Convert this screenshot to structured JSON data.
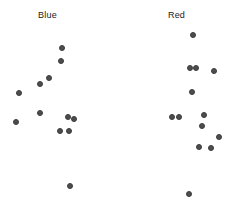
{
  "figure": {
    "width": 234,
    "height": 209,
    "background": "#ffffff"
  },
  "chart_data": {
    "type": "scatter",
    "title": "",
    "xlabel": "",
    "ylabel": "",
    "grid": false,
    "legend": "none",
    "marker": {
      "shape": "circle",
      "size_px": 6,
      "color": "#4d4d4d",
      "edge_color": "#3c3c3c",
      "opacity": 1
    },
    "xlim": [
      0,
      117
    ],
    "ylim": [
      209,
      0
    ],
    "panels": [
      {
        "name": "Blue",
        "label": "Blue",
        "origin_x": 0,
        "points": [
          {
            "x": 62,
            "y": 48
          },
          {
            "x": 61,
            "y": 61
          },
          {
            "x": 49,
            "y": 78
          },
          {
            "x": 40,
            "y": 84
          },
          {
            "x": 19,
            "y": 93
          },
          {
            "x": 40,
            "y": 113
          },
          {
            "x": 68,
            "y": 117
          },
          {
            "x": 74,
            "y": 119
          },
          {
            "x": 16,
            "y": 122
          },
          {
            "x": 60,
            "y": 131
          },
          {
            "x": 69,
            "y": 131
          },
          {
            "x": 70,
            "y": 186
          }
        ]
      },
      {
        "name": "Red",
        "label": "Red",
        "origin_x": 117,
        "points": [
          {
            "x": 193,
            "y": 35
          },
          {
            "x": 190,
            "y": 68
          },
          {
            "x": 196,
            "y": 68
          },
          {
            "x": 214,
            "y": 71
          },
          {
            "x": 192,
            "y": 92
          },
          {
            "x": 172,
            "y": 117
          },
          {
            "x": 179,
            "y": 117
          },
          {
            "x": 204,
            "y": 115
          },
          {
            "x": 202,
            "y": 126
          },
          {
            "x": 219,
            "y": 137
          },
          {
            "x": 199,
            "y": 147
          },
          {
            "x": 211,
            "y": 148
          },
          {
            "x": 189,
            "y": 194
          }
        ]
      }
    ]
  }
}
